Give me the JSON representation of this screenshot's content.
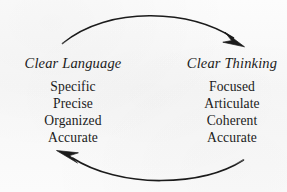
{
  "diagram": {
    "background_color": "#fafafa",
    "ink_color": "#1b1b1b",
    "columns": [
      {
        "id": "language",
        "heading": "Clear Language",
        "heading_style": "italic",
        "items": [
          "Specific",
          "Precise",
          "Organized",
          "Accurate"
        ]
      },
      {
        "id": "thinking",
        "heading": "Clear Thinking",
        "heading_style": "italic",
        "items": [
          "Focused",
          "Articulate",
          "Coherent",
          "Accurate"
        ]
      }
    ],
    "arrows": [
      {
        "id": "top",
        "from": "language",
        "to": "thinking",
        "direction": "left-to-right",
        "curve": "arc-upward",
        "head_position": "right"
      },
      {
        "id": "bottom",
        "from": "thinking",
        "to": "language",
        "direction": "right-to-left",
        "curve": "arc-downward",
        "head_position": "left"
      }
    ]
  }
}
